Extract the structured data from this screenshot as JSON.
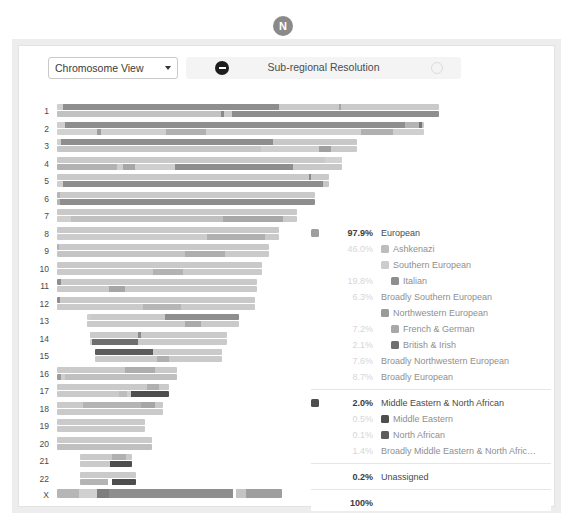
{
  "badge": {
    "letter": "N",
    "color": "#8a8a8a"
  },
  "toolbar": {
    "view_select": {
      "value": "Chromosome View",
      "icon": "chevron-down-icon"
    },
    "resolution": {
      "label": "Sub-regional Resolution",
      "minus_icon": "minus-circle-icon",
      "plus_icon": "plus-circle-icon"
    }
  },
  "chart_data": {
    "type": "chromosome-painting",
    "title": "Chromosome View",
    "ylabel": "Chromosome",
    "axis_labels": [
      "1",
      "2",
      "3",
      "4",
      "5",
      "6",
      "7",
      "8",
      "9",
      "10",
      "11",
      "12",
      "13",
      "14",
      "15",
      "16",
      "17",
      "18",
      "19",
      "20",
      "21",
      "22",
      "X"
    ],
    "note": "Each chromosome shows two haplotype bars (maternal / paternal) painted by ancestry segment.",
    "palette": {
      "european_broad": "#c9c9c9",
      "ashkenazi": "#b4b4b4",
      "southern_european": "#cccccc",
      "italian": "#8e8e8e",
      "broadly_southern": "#bdbdbd",
      "northwestern_european": "#9a9a9a",
      "french_german": "#a8a8a8",
      "british_irish": "#6f6f6f",
      "broadly_northwestern": "#b8b8b8",
      "middle_eastern_na": "#4e4e4e",
      "unassigned": "#e0e0e0"
    },
    "chromosomes": [
      {
        "label": "1",
        "offset": 0,
        "length": 382,
        "haplotypes": [
          [
            {
              "w": 6,
              "c": "#cfcfcf"
            },
            {
              "w": 216,
              "c": "#8e8e8e"
            },
            {
              "w": 60,
              "c": "#c9c9c9"
            },
            {
              "w": 2,
              "c": "#a5a5a5"
            },
            {
              "w": 98,
              "c": "#cacaca"
            }
          ],
          [
            {
              "w": 164,
              "c": "#c2c2c2"
            },
            {
              "w": 3,
              "c": "#8a8a8a"
            },
            {
              "w": 8,
              "c": "#cccccc"
            },
            {
              "w": 207,
              "c": "#8e8e8e"
            }
          ]
        ]
      },
      {
        "label": "2",
        "offset": 0,
        "length": 367,
        "haplotypes": [
          [
            {
              "w": 8,
              "c": "#cfcfcf"
            },
            {
              "w": 340,
              "c": "#8e8e8e"
            },
            {
              "w": 14,
              "c": "#b4b4b4"
            },
            {
              "w": 3,
              "c": "#777777"
            },
            {
              "w": 2,
              "c": "#c6c6c6"
            }
          ],
          [
            {
              "w": 40,
              "c": "#d2d2d2"
            },
            {
              "w": 4,
              "c": "#9d9d9d"
            },
            {
              "w": 65,
              "c": "#cfcfcf"
            },
            {
              "w": 40,
              "c": "#b0b0b0"
            },
            {
              "w": 155,
              "c": "#d0d0d0"
            },
            {
              "w": 32,
              "c": "#b0b0b0"
            },
            {
              "w": 31,
              "c": "#cfcfcf"
            }
          ]
        ]
      },
      {
        "label": "3",
        "offset": 0,
        "length": 300,
        "haplotypes": [
          [
            {
              "w": 4,
              "c": "#cfcfcf"
            },
            {
              "w": 212,
              "c": "#8e8e8e"
            },
            {
              "w": 84,
              "c": "#c8c8c8"
            }
          ],
          [
            {
              "w": 204,
              "c": "#c6c6c6"
            },
            {
              "w": 58,
              "c": "#cfcfcf"
            },
            {
              "w": 12,
              "c": "#a0a0a0"
            },
            {
              "w": 26,
              "c": "#cacaca"
            }
          ]
        ]
      },
      {
        "label": "4",
        "offset": 0,
        "length": 285,
        "haplotypes": [
          [
            {
              "w": 268,
              "c": "#c9c9c9"
            },
            {
              "w": 17,
              "c": "#d2d2d2"
            }
          ],
          [
            {
              "w": 60,
              "c": "#b2b2b2"
            },
            {
              "w": 6,
              "c": "#cfcfcf"
            },
            {
              "w": 12,
              "c": "#a7a7a7"
            },
            {
              "w": 40,
              "c": "#cfcfcf"
            },
            {
              "w": 118,
              "c": "#8e8e8e"
            },
            {
              "w": 49,
              "c": "#c8c8c8"
            }
          ]
        ]
      },
      {
        "label": "5",
        "offset": 0,
        "length": 272,
        "haplotypes": [
          [
            {
              "w": 252,
              "c": "#c9c9c9"
            },
            {
              "w": 2,
              "c": "#8a8a8a"
            },
            {
              "w": 18,
              "c": "#cacaca"
            }
          ],
          [
            {
              "w": 6,
              "c": "#cfcfcf"
            },
            {
              "w": 260,
              "c": "#8e8e8e"
            },
            {
              "w": 6,
              "c": "#c6c6c6"
            }
          ]
        ]
      },
      {
        "label": "6",
        "offset": 0,
        "length": 258,
        "haplotypes": [
          [
            {
              "w": 3,
              "c": "#b5b5b5"
            },
            {
              "w": 255,
              "c": "#c9c9c9"
            }
          ],
          [
            {
              "w": 3,
              "c": "#b5b5b5"
            },
            {
              "w": 255,
              "c": "#8e8e8e"
            }
          ]
        ]
      },
      {
        "label": "7",
        "offset": 0,
        "length": 240,
        "haplotypes": [
          [
            {
              "w": 240,
              "c": "#c9c9c9"
            }
          ],
          [
            {
              "w": 14,
              "c": "#cfcfcf"
            },
            {
              "w": 152,
              "c": "#c0c0c0"
            },
            {
              "w": 60,
              "c": "#a8a8a8"
            },
            {
              "w": 14,
              "c": "#cacaca"
            }
          ]
        ]
      },
      {
        "label": "8",
        "offset": 0,
        "length": 222,
        "haplotypes": [
          [
            {
              "w": 222,
              "c": "#c9c9c9"
            }
          ],
          [
            {
              "w": 150,
              "c": "#cccccc"
            },
            {
              "w": 58,
              "c": "#b0b0b0"
            },
            {
              "w": 14,
              "c": "#cacaca"
            }
          ]
        ]
      },
      {
        "label": "9",
        "offset": 0,
        "length": 212,
        "haplotypes": [
          [
            {
              "w": 2,
              "c": "#b0b0b0"
            },
            {
              "w": 210,
              "c": "#c9c9c9"
            }
          ],
          [
            {
              "w": 128,
              "c": "#c4c4c4"
            },
            {
              "w": 40,
              "c": "#aeaeae"
            },
            {
              "w": 44,
              "c": "#cacaca"
            }
          ]
        ]
      },
      {
        "label": "10",
        "offset": 0,
        "length": 205,
        "haplotypes": [
          [
            {
              "w": 205,
              "c": "#c9c9c9"
            }
          ],
          [
            {
              "w": 96,
              "c": "#cacaca"
            },
            {
              "w": 30,
              "c": "#b2b2b2"
            },
            {
              "w": 79,
              "c": "#cacaca"
            }
          ]
        ]
      },
      {
        "label": "11",
        "offset": 0,
        "length": 200,
        "haplotypes": [
          [
            {
              "w": 4,
              "c": "#8e8e8e"
            },
            {
              "w": 196,
              "c": "#c9c9c9"
            }
          ],
          [
            {
              "w": 52,
              "c": "#cacaca"
            },
            {
              "w": 16,
              "c": "#a6a6a6"
            },
            {
              "w": 132,
              "c": "#cacaca"
            }
          ]
        ]
      },
      {
        "label": "12",
        "offset": 0,
        "length": 198,
        "haplotypes": [
          [
            {
              "w": 3,
              "c": "#8e8e8e"
            },
            {
              "w": 195,
              "c": "#c9c9c9"
            }
          ],
          [
            {
              "w": 86,
              "c": "#cacaca"
            },
            {
              "w": 38,
              "c": "#b6b6b6"
            },
            {
              "w": 74,
              "c": "#cacaca"
            }
          ]
        ]
      },
      {
        "label": "13",
        "offset": 30,
        "length": 152,
        "haplotypes": [
          [
            {
              "w": 4,
              "c": "#cfcfcf"
            },
            {
              "w": 74,
              "c": "#cacaca"
            },
            {
              "w": 74,
              "c": "#8e8e8e"
            }
          ],
          [
            {
              "w": 98,
              "c": "#cacaca"
            },
            {
              "w": 16,
              "c": "#aaaaaa"
            },
            {
              "w": 38,
              "c": "#cacaca"
            }
          ]
        ]
      },
      {
        "label": "14",
        "offset": 33,
        "length": 137,
        "haplotypes": [
          [
            {
              "w": 48,
              "c": "#cacaca"
            },
            {
              "w": 3,
              "c": "#8a8a8a"
            },
            {
              "w": 86,
              "c": "#cacaca"
            }
          ],
          [
            {
              "w": 2,
              "c": "#cfcfcf"
            },
            {
              "w": 46,
              "c": "#6f6f6f"
            },
            {
              "w": 89,
              "c": "#cacaca"
            }
          ]
        ]
      },
      {
        "label": "15",
        "offset": 38,
        "length": 127,
        "haplotypes": [
          [
            {
              "w": 58,
              "c": "#5c5c5c"
            },
            {
              "w": 69,
              "c": "#cacaca"
            }
          ],
          [
            {
              "w": 62,
              "c": "#cacaca"
            },
            {
              "w": 12,
              "c": "#b0b0b0"
            },
            {
              "w": 53,
              "c": "#cacaca"
            }
          ]
        ]
      },
      {
        "label": "16",
        "offset": 0,
        "length": 120,
        "haplotypes": [
          [
            {
              "w": 68,
              "c": "#cacaca"
            },
            {
              "w": 30,
              "c": "#aeaeae"
            },
            {
              "w": 22,
              "c": "#cacaca"
            }
          ],
          [
            {
              "w": 4,
              "c": "#9b9b9b"
            },
            {
              "w": 4,
              "c": "#cfcfcf"
            },
            {
              "w": 112,
              "c": "#c0c0c0"
            }
          ]
        ]
      },
      {
        "label": "17",
        "offset": 0,
        "length": 112,
        "haplotypes": [
          [
            {
              "w": 90,
              "c": "#cacaca"
            },
            {
              "w": 12,
              "c": "#b0b0b0"
            },
            {
              "w": 10,
              "c": "#cacaca"
            }
          ],
          [
            {
              "w": 62,
              "c": "#cacaca"
            },
            {
              "w": 8,
              "c": "#bdbdbd"
            },
            {
              "w": 4,
              "c": "#cfcfcf"
            },
            {
              "w": 38,
              "c": "#4e4e4e"
            }
          ]
        ]
      },
      {
        "label": "18",
        "offset": 0,
        "length": 106,
        "haplotypes": [
          [
            {
              "w": 26,
              "c": "#cacaca"
            },
            {
              "w": 58,
              "c": "#b4b4b4"
            },
            {
              "w": 14,
              "c": "#a6a6a6"
            },
            {
              "w": 8,
              "c": "#cacaca"
            }
          ],
          [
            {
              "w": 106,
              "c": "#cacaca"
            }
          ]
        ]
      },
      {
        "label": "19",
        "offset": 0,
        "length": 88,
        "haplotypes": [
          [
            {
              "w": 88,
              "c": "#cacaca"
            }
          ],
          [
            {
              "w": 88,
              "c": "#cacaca"
            }
          ]
        ]
      },
      {
        "label": "20",
        "offset": 0,
        "length": 95,
        "haplotypes": [
          [
            {
              "w": 95,
              "c": "#cacaca"
            }
          ],
          [
            {
              "w": 95,
              "c": "#c0c0c0"
            }
          ]
        ]
      },
      {
        "label": "21",
        "offset": 23,
        "length": 52,
        "haplotypes": [
          [
            {
              "w": 32,
              "c": "#cacaca"
            },
            {
              "w": 14,
              "c": "#b0b0b0"
            },
            {
              "w": 6,
              "c": "#cacaca"
            }
          ],
          [
            {
              "w": 30,
              "c": "#cacaca"
            },
            {
              "w": 22,
              "c": "#4e4e4e"
            }
          ]
        ]
      },
      {
        "label": "22",
        "offset": 23,
        "length": 56,
        "haplotypes": [
          [
            {
              "w": 56,
              "c": "#cacaca"
            }
          ],
          [
            {
              "w": 28,
              "c": "#b4b4b4"
            },
            {
              "w": 4,
              "c": "#ffffff"
            },
            {
              "w": 24,
              "c": "#4e4e4e"
            }
          ]
        ]
      },
      {
        "label": "X",
        "offset": 0,
        "length": 225,
        "thick": true,
        "haplotypes": [
          [
            {
              "w": 22,
              "c": "#b6b6b6"
            },
            {
              "w": 18,
              "c": "#d0d0d0"
            },
            {
              "w": 12,
              "c": "#7d7d7d"
            },
            {
              "w": 124,
              "c": "#8e8e8e"
            },
            {
              "w": 3,
              "c": "#ffffff"
            },
            {
              "w": 10,
              "c": "#c4c4c4"
            },
            {
              "w": 36,
              "c": "#9e9e9e"
            }
          ]
        ]
      }
    ]
  },
  "legend": {
    "groups": [
      {
        "rows": [
          {
            "pct": "97.9%",
            "pct_style": "strong",
            "name": "European",
            "depth": 0,
            "swatch": "#9e9e9e",
            "name_style": "dark"
          },
          {
            "pct": "46.0%",
            "pct_style": "faint",
            "name": "Ashkenazi",
            "depth": 1,
            "swatch": "#bdbdbd",
            "name_style": "dim"
          },
          {
            "pct": "",
            "pct_style": "faint",
            "name": "Southern European",
            "depth": 1,
            "swatch": "#cccccc",
            "name_style": "dim"
          },
          {
            "pct": "19.8%",
            "pct_style": "faint",
            "name": "Italian",
            "depth": 2,
            "swatch": "#8e8e8e",
            "name_style": "dim"
          },
          {
            "pct": "6.3%",
            "pct_style": "faint",
            "name": "Broadly Southern European",
            "depth": 3,
            "swatch": "",
            "name_style": "dim"
          },
          {
            "pct": "",
            "pct_style": "faint",
            "name": "Northwestern European",
            "depth": 1,
            "swatch": "#9a9a9a",
            "name_style": "dim"
          },
          {
            "pct": "7.2%",
            "pct_style": "faint",
            "name": "French & German",
            "depth": 2,
            "swatch": "#a8a8a8",
            "name_style": "dim"
          },
          {
            "pct": "2.1%",
            "pct_style": "faint",
            "name": "British & Irish",
            "depth": 2,
            "swatch": "#6f6f6f",
            "name_style": "dim"
          },
          {
            "pct": "7.6%",
            "pct_style": "faint",
            "name": "Broadly Northwestern European",
            "depth": 3,
            "swatch": "",
            "name_style": "dim"
          },
          {
            "pct": "8.7%",
            "pct_style": "faint",
            "name": "Broadly European",
            "depth": 1,
            "swatch": "",
            "name_style": "dim"
          }
        ]
      },
      {
        "rows": [
          {
            "pct": "2.0%",
            "pct_style": "strong",
            "name": "Middle Eastern & North African",
            "depth": 0,
            "swatch": "#4e4e4e",
            "name_style": "dark"
          },
          {
            "pct": "0.5%",
            "pct_style": "faint",
            "name": "Middle Eastern",
            "depth": 1,
            "swatch": "#4e4e4e",
            "name_style": "dim"
          },
          {
            "pct": "0.1%",
            "pct_style": "faint",
            "name": "North African",
            "depth": 1,
            "swatch": "#5c5c5c",
            "name_style": "dim"
          },
          {
            "pct": "1.4%",
            "pct_style": "faint",
            "name": "Broadly Middle Eastern & North Afric…",
            "depth": 3,
            "swatch": "",
            "name_style": "dim"
          }
        ]
      },
      {
        "rows": [
          {
            "pct": "0.2%",
            "pct_style": "strong",
            "name": "Unassigned",
            "depth": 0,
            "swatch": "",
            "name_style": "dark"
          }
        ]
      },
      {
        "rows": [
          {
            "pct": "100%",
            "pct_style": "strong",
            "name": "",
            "depth": 0,
            "swatch": "",
            "name_style": "dark"
          }
        ]
      }
    ]
  }
}
